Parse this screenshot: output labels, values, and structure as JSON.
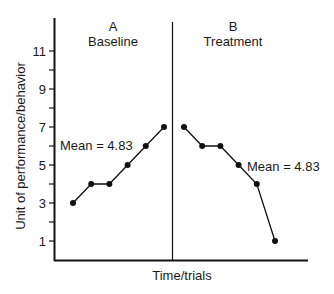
{
  "chart_data": {
    "type": "line",
    "title": "",
    "xlabel": "Time/trials",
    "ylabel": "Unit of performance/behavior",
    "ylim": [
      0,
      12.5
    ],
    "yticks_labeled": [
      1,
      3,
      5,
      7,
      9,
      11
    ],
    "yticks_minor": [
      2,
      4,
      6,
      8,
      10
    ],
    "grid": false,
    "legend": null,
    "phases": [
      {
        "letter": "A",
        "name": "Baseline",
        "values": [
          3,
          4,
          4,
          5,
          6,
          7
        ],
        "mean_label": "Mean = 4.83",
        "mean": 4.83
      },
      {
        "letter": "B",
        "name": "Treatment",
        "values": [
          7,
          6,
          6,
          5,
          4,
          1
        ],
        "mean_label": "Mean = 4.83",
        "mean": 4.83
      }
    ],
    "series": [
      {
        "name": "Baseline",
        "x": [
          1,
          2,
          3,
          4,
          5,
          6
        ],
        "values": [
          3,
          4,
          4,
          5,
          6,
          7
        ]
      },
      {
        "name": "Treatment",
        "x": [
          7,
          8,
          9,
          10,
          11,
          12
        ],
        "values": [
          7,
          6,
          6,
          5,
          4,
          1
        ]
      }
    ],
    "annotations": [
      "Mean = 4.83",
      "Mean = 4.83"
    ],
    "phase_divider_after_x": 6
  },
  "labels": {
    "phaseA_letter": "A",
    "phaseA_name": "Baseline",
    "phaseB_letter": "B",
    "phaseB_name": "Treatment",
    "meanA": "Mean = 4.83",
    "meanB": "Mean = 4.83",
    "xlabel": "Time/trials",
    "ylabel": "Unit of performance/behavior",
    "ticks": [
      "1",
      "3",
      "5",
      "7",
      "9",
      "11"
    ]
  }
}
